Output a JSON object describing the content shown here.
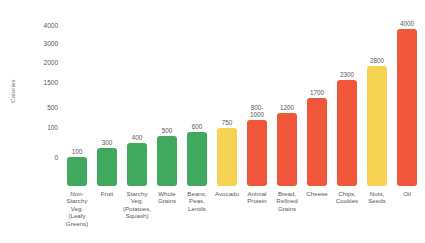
{
  "chart_data": {
    "type": "bar",
    "title": "",
    "xlabel": "",
    "ylabel": "Calories",
    "grid": false,
    "legend": "none",
    "axis_scale": "non-linear (compressed low end)",
    "ytick_labels": [
      "4000",
      "3000",
      "2000",
      "1500",
      "500",
      "100",
      "0"
    ],
    "ytick_values": [
      4000,
      3000,
      2000,
      1500,
      500,
      100,
      0
    ],
    "ylim": [
      0,
      4000
    ],
    "categories": [
      "Non-Starchy Veg. (Leafy Greens)",
      "Fruit",
      "Starchy Veg. (Potatoes, Squash)",
      "Whole Grains",
      "Beans, Peas, Lentils",
      "Avocado",
      "Animal Protein",
      "Bread, Refined Grains",
      "Cheese",
      "Chips, Cookies",
      "Nuts, Seeds",
      "Oil"
    ],
    "values": [
      100,
      300,
      400,
      500,
      600,
      750,
      1000,
      1200,
      1700,
      2300,
      2800,
      4000
    ],
    "value_labels": [
      "100",
      "300",
      "400",
      "500",
      "600",
      "750",
      "800-\n1000",
      "1200",
      "1700",
      "2300",
      "2800",
      "4000"
    ],
    "bar_colors": [
      "#41A85F",
      "#41A85F",
      "#41A85F",
      "#41A85F",
      "#41A85F",
      "#F5D251",
      "#F0563A",
      "#F0563A",
      "#F0563A",
      "#F0563A",
      "#F5D251",
      "#F0563A"
    ],
    "palette": {
      "green": "#41A85F",
      "yellow": "#F5D251",
      "orange": "#F0563A",
      "text": "#58585a",
      "background": "#ffffff"
    }
  },
  "bars": [
    {
      "label_lines": [
        "Non-",
        "Starchy",
        "Veg.",
        "(Leafy",
        "Greens)"
      ],
      "value_lines": [
        "100"
      ],
      "value": 100,
      "color": "#41A85F",
      "px_top": 157
    },
    {
      "label_lines": [
        "Fruit"
      ],
      "value_lines": [
        "300"
      ],
      "value": 300,
      "color": "#41A85F",
      "px_top": 148
    },
    {
      "label_lines": [
        "Starchy",
        "Veg.",
        "(Potatoes,",
        "Squash)"
      ],
      "value_lines": [
        "400"
      ],
      "value": 400,
      "color": "#41A85F",
      "px_top": 143
    },
    {
      "label_lines": [
        "Whole",
        "Grains"
      ],
      "value_lines": [
        "500"
      ],
      "value": 500,
      "color": "#41A85F",
      "px_top": 136
    },
    {
      "label_lines": [
        "Beans,",
        "Peas,",
        "Lentils"
      ],
      "value_lines": [
        "600"
      ],
      "value": 600,
      "color": "#41A85F",
      "px_top": 132
    },
    {
      "label_lines": [
        "Avocado"
      ],
      "value_lines": [
        "750"
      ],
      "value": 750,
      "color": "#F5D251",
      "px_top": 128
    },
    {
      "label_lines": [
        "Animal",
        "Protein"
      ],
      "value_lines": [
        "800-",
        "1000"
      ],
      "value": 1000,
      "color": "#F0563A",
      "px_top": 120
    },
    {
      "label_lines": [
        "Bread,",
        "Refined",
        "Grains"
      ],
      "value_lines": [
        "1200"
      ],
      "value": 1200,
      "color": "#F0563A",
      "px_top": 113
    },
    {
      "label_lines": [
        "Cheese"
      ],
      "value_lines": [
        "1700"
      ],
      "value": 1700,
      "color": "#F0563A",
      "px_top": 98
    },
    {
      "label_lines": [
        "Chips,",
        "Cookies"
      ],
      "value_lines": [
        "2300"
      ],
      "value": 2300,
      "color": "#F0563A",
      "px_top": 80
    },
    {
      "label_lines": [
        "Nuts,",
        "Seeds"
      ],
      "value_lines": [
        "2800"
      ],
      "value": 2800,
      "color": "#F5D251",
      "px_top": 66
    },
    {
      "label_lines": [
        "Oil"
      ],
      "value_lines": [
        "4000"
      ],
      "value": 4000,
      "color": "#F0563A",
      "px_top": 29
    }
  ],
  "y_axis": {
    "title": "Calories",
    "ticks": [
      {
        "label": "4000",
        "px_y": 25
      },
      {
        "label": "3000",
        "px_y": 43
      },
      {
        "label": "2000",
        "px_y": 62
      },
      {
        "label": "1500",
        "px_y": 82
      },
      {
        "label": "500",
        "px_y": 107
      },
      {
        "label": "100",
        "px_y": 127
      },
      {
        "label": "0",
        "px_y": 157
      }
    ]
  }
}
